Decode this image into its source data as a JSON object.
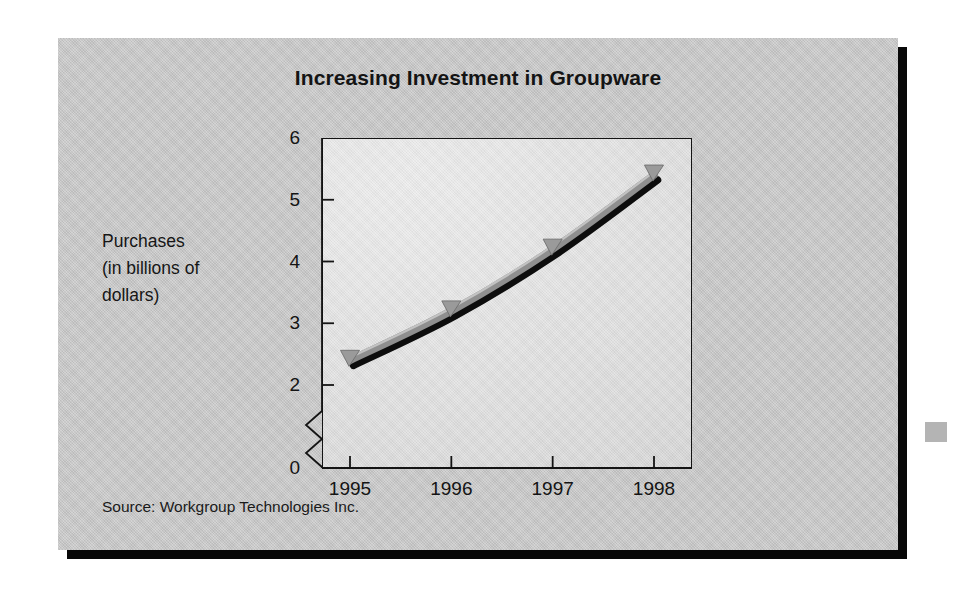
{
  "figure": {
    "title": "Increasing Investment in Groupware",
    "source_note": "Source: Workgroup Technologies Inc.",
    "y_caption_lines": [
      "Purchases",
      "(in billions of",
      "dollars)"
    ],
    "card_color": "#c9c9c9",
    "plot_bg_color": "#e6e6e6",
    "shadow_color": "#080808"
  },
  "chart_data": {
    "type": "line",
    "title": "Increasing Investment in Groupware",
    "subtitle": "",
    "xlabel": "",
    "ylabel": "Purchases (in billions of dollars)",
    "categories": [
      "1995",
      "1996",
      "1997",
      "1998"
    ],
    "x": [
      1995,
      1996,
      1997,
      1998
    ],
    "values": [
      2.4,
      3.2,
      4.2,
      5.4
    ],
    "series": [
      {
        "name": "Purchases",
        "values": [
          2.4,
          3.2,
          4.2,
          5.4
        ],
        "line_color": "#8f8f8f",
        "shadow_color": "#0d0d0d",
        "marker": "triangle-down",
        "marker_color": "#9a9a9a"
      }
    ],
    "ylim": [
      2,
      6
    ],
    "y_ticks": [
      2,
      3,
      4,
      5,
      6
    ],
    "y_tick_labels": [
      "2",
      "3",
      "4",
      "5",
      "6"
    ],
    "y_origin_label": "0",
    "axis_break": true,
    "axis_break_note": "zigzag break on y-axis between 0 and 2",
    "x_ticks": [
      "1995",
      "1996",
      "1997",
      "1998"
    ],
    "grid": false,
    "legend": "none",
    "annotations": [
      "Source: Workgroup Technologies Inc."
    ]
  }
}
